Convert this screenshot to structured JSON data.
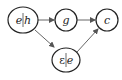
{
  "diagram": {
    "nodes": [
      {
        "id": "eh",
        "label_left": "e",
        "label_right": "h",
        "cx": 23,
        "cy": 20,
        "rx": 15,
        "ry": 13
      },
      {
        "id": "g",
        "label": "g",
        "cx": 66,
        "cy": 20,
        "rx": 11,
        "ry": 11
      },
      {
        "id": "c",
        "label": "c",
        "cx": 107,
        "cy": 20,
        "rx": 11,
        "ry": 11
      },
      {
        "id": "epse",
        "label_left": "ε",
        "label_right": "e",
        "cx": 66,
        "cy": 60,
        "rx": 14,
        "ry": 12
      }
    ],
    "edges": [
      {
        "from": "eh",
        "to": "g"
      },
      {
        "from": "g",
        "to": "c"
      },
      {
        "from": "eh",
        "to": "epse"
      },
      {
        "from": "epse",
        "to": "c"
      }
    ],
    "colors": {
      "stroke": "#222222",
      "edge": "#555555",
      "background": "#ffffff"
    }
  }
}
